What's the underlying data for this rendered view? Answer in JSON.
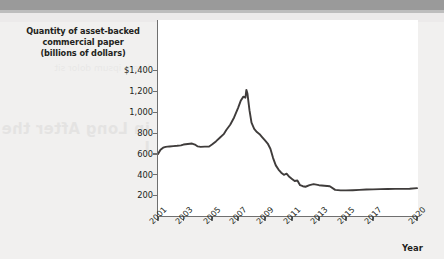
{
  "figure": {
    "title_lines": "Quantity of asset-backed\ncommercial paper\n(billions of dollars)",
    "x_axis_title": "Year",
    "line_color": "#3f3c3b",
    "axis_color": "#6f6f6f",
    "plot_background": "#ffffff",
    "page_background": "#f1f0ef"
  },
  "bleed_text": "in Long\nAfter the J",
  "bleed_text_small": "lorem ipsum dolor sit",
  "chart_data": {
    "type": "line",
    "title": "Quantity of asset-backed commercial paper (billions of dollars)",
    "xlabel": "Year",
    "ylabel": "Quantity of asset-backed commercial paper (billions of dollars)",
    "xlim": [
      2001,
      2020
    ],
    "ylim": [
      0,
      1400
    ],
    "yticks": [
      200,
      400,
      600,
      800,
      1000,
      1200,
      1400
    ],
    "ytick_labels": [
      "200",
      "400",
      "600",
      "800",
      "1,000",
      "1,200",
      "$1,400"
    ],
    "xticks": [
      2001,
      2003,
      2005,
      2007,
      2009,
      2011,
      2013,
      2015,
      2017,
      2020
    ],
    "xtick_labels": [
      "2001",
      "2003",
      "2005",
      "2007",
      "2009",
      "2011",
      "2013",
      "2015",
      "2017",
      "2020"
    ],
    "grid": false,
    "legend": null,
    "series": [
      {
        "name": "Asset-backed commercial paper outstanding",
        "x": [
          2001.0,
          2001.2,
          2001.4,
          2001.6,
          2001.9,
          2002.2,
          2002.5,
          2002.8,
          2003.0,
          2003.3,
          2003.6,
          2003.8,
          2004.0,
          2004.2,
          2004.5,
          2004.8,
          2005.0,
          2005.3,
          2005.6,
          2005.9,
          2006.1,
          2006.4,
          2006.7,
          2007.0,
          2007.2,
          2007.4,
          2007.55,
          2007.62,
          2007.7,
          2007.85,
          2008.0,
          2008.2,
          2008.4,
          2008.6,
          2008.8,
          2009.0,
          2009.2,
          2009.4,
          2009.6,
          2009.8,
          2010.0,
          2010.2,
          2010.4,
          2010.6,
          2010.8,
          2011.0,
          2011.2,
          2011.4,
          2011.6,
          2011.8,
          2012.0,
          2012.3,
          2012.6,
          2013.0,
          2013.4,
          2013.8,
          2014.2,
          2014.6,
          2015.0,
          2015.5,
          2016.0,
          2016.5,
          2017.0,
          2017.5,
          2018.0,
          2018.5,
          2019.0,
          2019.5,
          2020.0
        ],
        "y": [
          600,
          640,
          660,
          668,
          672,
          675,
          678,
          682,
          690,
          695,
          700,
          690,
          672,
          668,
          670,
          672,
          690,
          720,
          755,
          790,
          830,
          880,
          950,
          1040,
          1110,
          1150,
          1140,
          1215,
          1180,
          1020,
          900,
          840,
          810,
          790,
          760,
          730,
          700,
          650,
          560,
          490,
          450,
          420,
          400,
          410,
          380,
          360,
          340,
          345,
          300,
          290,
          285,
          300,
          310,
          300,
          295,
          290,
          255,
          250,
          250,
          252,
          255,
          258,
          260,
          262,
          263,
          265,
          265,
          266,
          272
        ]
      }
    ]
  }
}
